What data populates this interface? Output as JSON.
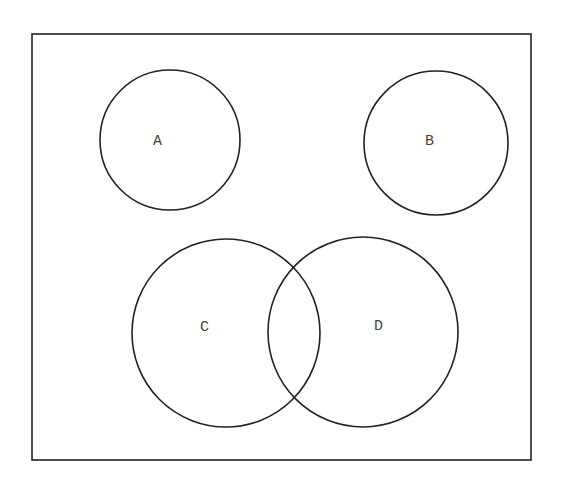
{
  "diagram": {
    "type": "venn",
    "universe": {
      "x": 32,
      "y": 34,
      "width": 499,
      "height": 426
    },
    "sets": [
      {
        "label": "A",
        "cx": 170,
        "cy": 140,
        "r": 70,
        "lx": 153,
        "ly": 145
      },
      {
        "label": "B",
        "cx": 436,
        "cy": 143,
        "r": 72,
        "lx": 425,
        "ly": 145
      },
      {
        "label": "C",
        "cx": 226,
        "cy": 333,
        "r": 94,
        "lx": 200,
        "ly": 331
      },
      {
        "label": "D",
        "cx": 363,
        "cy": 332,
        "r": 95,
        "lx": 374,
        "ly": 330
      }
    ],
    "stroke_color": "#222222"
  }
}
